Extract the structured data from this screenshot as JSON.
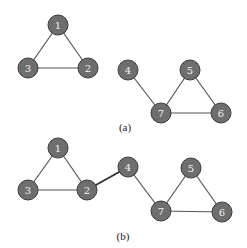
{
  "diagram": {
    "subfigures": [
      {
        "caption": "(a)",
        "caption_pos": [
          125,
          131
        ],
        "nodes": [
          {
            "id": "1",
            "x": 58,
            "y": 25
          },
          {
            "id": "2",
            "x": 88,
            "y": 68
          },
          {
            "id": "3",
            "x": 28,
            "y": 68
          },
          {
            "id": "4",
            "x": 128,
            "y": 70
          },
          {
            "id": "5",
            "x": 190,
            "y": 70
          },
          {
            "id": "6",
            "x": 221,
            "y": 113
          },
          {
            "id": "7",
            "x": 161,
            "y": 113
          }
        ],
        "edges": [
          {
            "from": "1",
            "to": "2",
            "bold": false
          },
          {
            "from": "1",
            "to": "3",
            "bold": false
          },
          {
            "from": "2",
            "to": "3",
            "bold": false
          },
          {
            "from": "4",
            "to": "7",
            "bold": false
          },
          {
            "from": "5",
            "to": "7",
            "bold": false
          },
          {
            "from": "5",
            "to": "6",
            "bold": false
          },
          {
            "from": "6",
            "to": "7",
            "bold": false
          }
        ]
      },
      {
        "caption": "(b)",
        "caption_pos": [
          123,
          240
        ],
        "nodes": [
          {
            "id": "1",
            "x": 58,
            "y": 148
          },
          {
            "id": "2",
            "x": 87,
            "y": 190
          },
          {
            "id": "3",
            "x": 28,
            "y": 190
          },
          {
            "id": "4",
            "x": 128,
            "y": 167
          },
          {
            "id": "5",
            "x": 191,
            "y": 168
          },
          {
            "id": "6",
            "x": 222,
            "y": 212
          },
          {
            "id": "7",
            "x": 161,
            "y": 211
          }
        ],
        "edges": [
          {
            "from": "1",
            "to": "2",
            "bold": false
          },
          {
            "from": "1",
            "to": "3",
            "bold": false
          },
          {
            "from": "2",
            "to": "3",
            "bold": false
          },
          {
            "from": "2",
            "to": "4",
            "bold": true
          },
          {
            "from": "4",
            "to": "7",
            "bold": false
          },
          {
            "from": "5",
            "to": "7",
            "bold": false
          },
          {
            "from": "5",
            "to": "6",
            "bold": false
          },
          {
            "from": "6",
            "to": "7",
            "bold": false
          }
        ]
      }
    ],
    "node_radius": 10,
    "colors": {
      "node_fill": "#6e6e6e",
      "node_stroke": "#3a3a3a",
      "node_label": "#f2f2f2",
      "edge": "#555555",
      "bold_edge": "#333333",
      "caption": "#222222"
    }
  }
}
